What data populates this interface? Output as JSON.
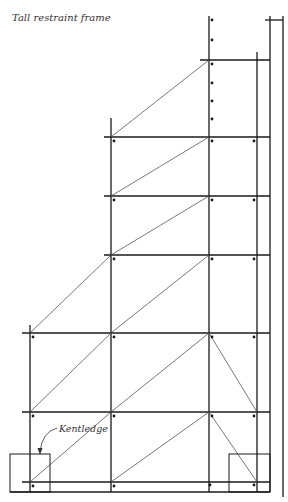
{
  "title": "Tall restraint frame",
  "annotation": {
    "label": "Kentledge"
  },
  "colors": {
    "line": "#1a1a1a",
    "brace": "#555555",
    "text": "#333333",
    "background": "#ffffff"
  },
  "frame": {
    "standards": [
      {
        "x": 30,
        "y1": 325,
        "y2": 492
      },
      {
        "x": 111,
        "y1": 118,
        "y2": 492
      },
      {
        "x": 209,
        "y1": 16,
        "y2": 492
      },
      {
        "x": 257,
        "y1": 52,
        "y2": 492
      },
      {
        "x": 270,
        "y1": 16,
        "y2": 492
      },
      {
        "x": 283,
        "y1": 16,
        "y2": 497
      }
    ],
    "ledgers": [
      {
        "y": 20,
        "x1": 265,
        "x2": 283
      },
      {
        "y": 60,
        "x1": 200,
        "x2": 270
      },
      {
        "y": 137,
        "x1": 104,
        "x2": 270
      },
      {
        "y": 196,
        "x1": 104,
        "x2": 270
      },
      {
        "y": 255,
        "x1": 104,
        "x2": 270
      },
      {
        "y": 333,
        "x1": 22,
        "x2": 270
      },
      {
        "y": 412,
        "x1": 22,
        "x2": 270
      },
      {
        "y": 482,
        "x1": 22,
        "x2": 270
      },
      {
        "y": 492,
        "x1": 10,
        "x2": 270
      }
    ],
    "braces": [
      {
        "x1": 111,
        "y1": 137,
        "x2": 209,
        "y2": 60
      },
      {
        "x1": 111,
        "y1": 196,
        "x2": 209,
        "y2": 137
      },
      {
        "x1": 111,
        "y1": 255,
        "x2": 209,
        "y2": 196
      },
      {
        "x1": 30,
        "y1": 333,
        "x2": 111,
        "y2": 255
      },
      {
        "x1": 111,
        "y1": 333,
        "x2": 209,
        "y2": 255
      },
      {
        "x1": 30,
        "y1": 412,
        "x2": 111,
        "y2": 333
      },
      {
        "x1": 111,
        "y1": 412,
        "x2": 209,
        "y2": 333
      },
      {
        "x1": 209,
        "y1": 333,
        "x2": 257,
        "y2": 412
      },
      {
        "x1": 30,
        "y1": 482,
        "x2": 111,
        "y2": 412
      },
      {
        "x1": 111,
        "y1": 482,
        "x2": 209,
        "y2": 412
      },
      {
        "x1": 209,
        "y1": 412,
        "x2": 257,
        "y2": 482
      }
    ],
    "couplers": [
      [
        212,
        20
      ],
      [
        212,
        40
      ],
      [
        212,
        64
      ],
      [
        212,
        83
      ],
      [
        212,
        101
      ],
      [
        212,
        119
      ],
      [
        114,
        141
      ],
      [
        212,
        141
      ],
      [
        254,
        141
      ],
      [
        114,
        200
      ],
      [
        212,
        200
      ],
      [
        254,
        200
      ],
      [
        114,
        259
      ],
      [
        212,
        259
      ],
      [
        254,
        259
      ],
      [
        33,
        337
      ],
      [
        114,
        337
      ],
      [
        212,
        337
      ],
      [
        254,
        337
      ],
      [
        33,
        416
      ],
      [
        114,
        416
      ],
      [
        212,
        416
      ],
      [
        254,
        416
      ],
      [
        33,
        486
      ],
      [
        114,
        486
      ],
      [
        210,
        485
      ],
      [
        254,
        485
      ]
    ],
    "kentledge_blocks": [
      {
        "x": 10,
        "y": 454,
        "w": 40,
        "h": 38
      },
      {
        "x": 229,
        "y": 454,
        "w": 41,
        "h": 38
      }
    ]
  }
}
